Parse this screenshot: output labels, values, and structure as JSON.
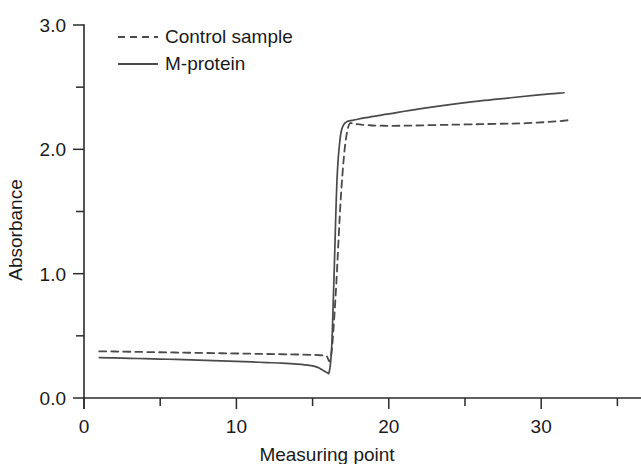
{
  "chart_data": {
    "type": "line",
    "title": "",
    "xlabel": "Measuring point",
    "ylabel": "Absorbance",
    "xlim": [
      0,
      35.5
    ],
    "ylim": [
      0.0,
      3.0
    ],
    "grid": false,
    "legend_position": "top-left-inside",
    "x_ticks": [
      0,
      5,
      10,
      15,
      20,
      25,
      30,
      35
    ],
    "x_tick_labels": [
      "0",
      "",
      "10",
      "",
      "20",
      "",
      "30",
      ""
    ],
    "y_ticks": [
      0.0,
      0.5,
      1.0,
      1.5,
      2.0,
      2.5,
      3.0
    ],
    "y_tick_labels": [
      "0.0",
      "",
      "1.0",
      "",
      "2.0",
      "",
      "3.0"
    ],
    "line_color": "#4a4a4a",
    "series": [
      {
        "name": "Control sample",
        "style": "dashed",
        "color": "#4a4a4a",
        "x": [
          1.0,
          2.0,
          3.0,
          4.0,
          5.0,
          6.0,
          7.0,
          8.0,
          9.0,
          10.0,
          11.0,
          12.0,
          13.0,
          14.0,
          15.0,
          15.5,
          15.9,
          16.2,
          16.5,
          16.9,
          17.3,
          17.8,
          18.5,
          19.5,
          21.0,
          23.0,
          25.0,
          27.0,
          29.0,
          31.0,
          31.8
        ],
        "y": [
          0.375,
          0.374,
          0.372,
          0.37,
          0.368,
          0.366,
          0.364,
          0.362,
          0.36,
          0.358,
          0.356,
          0.354,
          0.352,
          0.35,
          0.347,
          0.344,
          0.338,
          0.33,
          0.8,
          1.7,
          2.16,
          2.2,
          2.195,
          2.19,
          2.19,
          2.195,
          2.2,
          2.205,
          2.21,
          2.225,
          2.235
        ]
      },
      {
        "name": "M-protein",
        "style": "solid",
        "color": "#4a4a4a",
        "x": [
          1.0,
          2.0,
          3.0,
          4.0,
          5.0,
          6.0,
          7.0,
          8.0,
          9.0,
          10.0,
          11.0,
          12.0,
          13.0,
          14.0,
          14.8,
          15.3,
          15.7,
          15.95,
          16.1,
          16.25,
          16.4,
          16.6,
          16.8,
          17.0,
          17.3,
          17.7,
          18.5,
          20.0,
          22.0,
          24.0,
          26.0,
          28.0,
          30.0,
          31.5
        ],
        "y": [
          0.325,
          0.322,
          0.319,
          0.316,
          0.313,
          0.31,
          0.306,
          0.302,
          0.298,
          0.294,
          0.29,
          0.285,
          0.28,
          0.272,
          0.262,
          0.248,
          0.222,
          0.205,
          0.215,
          0.4,
          0.95,
          1.75,
          2.08,
          2.19,
          2.225,
          2.235,
          2.255,
          2.285,
          2.325,
          2.36,
          2.39,
          2.415,
          2.44,
          2.455
        ]
      }
    ]
  },
  "legend": {
    "items": [
      {
        "label": "Control sample",
        "style": "dashed"
      },
      {
        "label": "M-protein",
        "style": "solid"
      }
    ]
  }
}
